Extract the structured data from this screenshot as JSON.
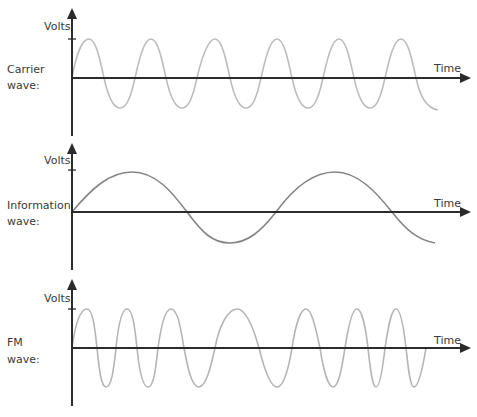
{
  "colors": {
    "axis": "#2b2b2b",
    "carrier": "#bdbdbd",
    "information": "#858585",
    "fm": "#b5b5b5",
    "text": "#3a3a3a"
  },
  "panels": [
    {
      "id": "carrier",
      "label_line1": "Carrier",
      "label_line2": "wave:",
      "y_axis_label": "Volts",
      "x_axis_label": "Time",
      "origin_x": 72,
      "baseline_y": 78,
      "axis_top_y": 8,
      "axis_bottom_y": 136,
      "tick_y": 39,
      "amplitude": 31,
      "wave_end_x": 438,
      "description": "constant-frequency sine, ~6 cycles, period ~62px"
    },
    {
      "id": "information",
      "label_line1": "Information",
      "label_line2": "wave:",
      "y_axis_label": "Volts",
      "x_axis_label": "Time",
      "origin_x": 72,
      "baseline_y": 212,
      "axis_top_y": 143,
      "axis_bottom_y": 270,
      "tick_y": 170,
      "amplitude": 31,
      "wave_end_x": 435,
      "description": "low-frequency sine, ~1.75 cycles, period ~205px"
    },
    {
      "id": "fm",
      "label_line1": "FM",
      "label_line2": "wave:",
      "y_axis_label": "Volts",
      "x_axis_label": "Time",
      "origin_x": 72,
      "baseline_y": 348,
      "axis_top_y": 278,
      "axis_bottom_y": 406,
      "tick_y": 309,
      "amplitude": 38,
      "wave_end_x": 426,
      "description": "frequency-modulated sine: compressed where information wave is high, stretched where low"
    }
  ]
}
